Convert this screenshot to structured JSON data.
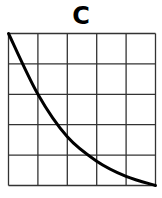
{
  "title": "C",
  "chart_data": {
    "type": "line",
    "title": "C",
    "xlabel": "",
    "ylabel": "",
    "grid": true,
    "grid_cells": [
      5,
      5
    ],
    "xlim": [
      0,
      5
    ],
    "ylim": [
      0,
      5
    ],
    "series": [
      {
        "name": "curve",
        "x": [
          0,
          1,
          2,
          3,
          4,
          5
        ],
        "y": [
          5,
          3,
          1.6,
          0.8,
          0.3,
          0
        ]
      }
    ]
  },
  "colors": {
    "line": "#000000",
    "grid": "#333333",
    "background": "#ffffff"
  }
}
